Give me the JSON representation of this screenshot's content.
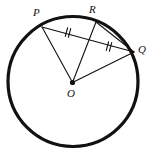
{
  "figure": {
    "type": "circle-geometry-diagram",
    "background_color": "#ffffff",
    "stroke_color": "#111111",
    "circle": {
      "name": "main-circle",
      "center_x": 73,
      "center_y": 81.5,
      "radius": 65,
      "stroke_width": 3.2
    },
    "center_point": {
      "name": "center-point-O",
      "x": 72.5,
      "y": 82.5,
      "radius": 2.6
    },
    "points": [
      {
        "id": "P",
        "label": "P",
        "x": 42,
        "y": 27,
        "label_x": 33,
        "label_y": 7
      },
      {
        "id": "R",
        "label": "R",
        "x": 96,
        "y": 22,
        "label_x": 89,
        "label_y": 4
      },
      {
        "id": "Q",
        "label": "Q",
        "x": 134,
        "y": 52,
        "label_x": 138,
        "label_y": 44
      },
      {
        "id": "O",
        "label": "O",
        "x": 72.5,
        "y": 82.5,
        "label_x": 67,
        "label_y": 88
      }
    ],
    "segments": [
      {
        "name": "segment-PQ",
        "from": "P",
        "to": "Q",
        "x1": 42,
        "y1": 27,
        "x2": 134,
        "y2": 52,
        "stroke_width": 1.1
      },
      {
        "name": "segment-PO",
        "from": "P",
        "to": "O",
        "x1": 42,
        "y1": 27,
        "x2": 72.5,
        "y2": 82.5,
        "stroke_width": 1.1
      },
      {
        "name": "segment-RO",
        "from": "R",
        "to": "O",
        "x1": 96,
        "y1": 22,
        "x2": 72.5,
        "y2": 82.5,
        "stroke_width": 1.1
      },
      {
        "name": "segment-RQ",
        "from": "R",
        "to": "Q",
        "x1": 96,
        "y1": 22,
        "x2": 134,
        "y2": 52,
        "stroke_width": 1.1
      },
      {
        "name": "segment-OQ",
        "from": "O",
        "to": "Q",
        "x1": 72.5,
        "y1": 82.5,
        "x2": 134,
        "y2": 52,
        "stroke_width": 1.1
      }
    ],
    "tick_marks": [
      {
        "name": "congruence-tick-PX",
        "on_segment": "segment-PQ",
        "count": 2,
        "x": 68,
        "y": 32.5,
        "angle_deg": 15.2,
        "length": 9,
        "spacing": 3.2,
        "stroke_width": 1.1
      },
      {
        "name": "congruence-tick-XQ",
        "on_segment": "segment-PQ",
        "count": 2,
        "x": 109,
        "y": 46.5,
        "angle_deg": 15.2,
        "length": 9,
        "spacing": 3.2,
        "stroke_width": 1.1
      }
    ]
  }
}
